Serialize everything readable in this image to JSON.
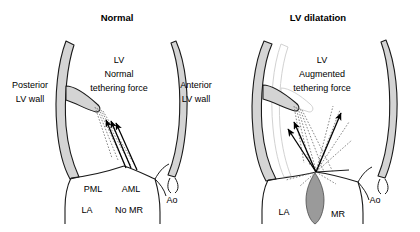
{
  "figure": {
    "type": "medical-diagram",
    "background_color": "#ffffff",
    "wall_fill": "#d4d4d4",
    "wall_stroke": "#1a1a1a",
    "jet_fill": "#9a9a9a",
    "ghost_stroke": "#cfcfcf",
    "chordae_stroke": "#555555",
    "arrow_color": "#000000"
  },
  "panels": [
    {
      "id": "normal",
      "title": "Normal",
      "labels": {
        "chamber": "LV",
        "force_line1": "Normal",
        "force_line2": "tethering force",
        "posterior_line1": "Posterior",
        "posterior_line2": "LV wall",
        "anterior_line1": "Anterior",
        "anterior_line2": "LV wall",
        "pml": "PML",
        "aml": "AML",
        "ao": "Ao",
        "la": "LA",
        "mr": "No MR"
      },
      "arrows": 3
    },
    {
      "id": "dilatation",
      "title": "LV dilatation",
      "labels": {
        "chamber": "LV",
        "force_line1": "Augmented",
        "force_line2": "tethering force",
        "ao": "Ao",
        "la": "LA",
        "mr": "MR"
      },
      "arrows": 3
    }
  ]
}
